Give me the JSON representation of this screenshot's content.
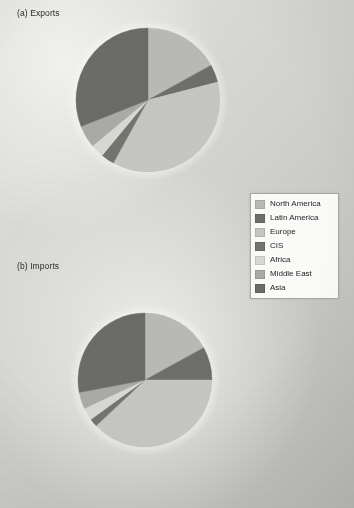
{
  "figure": {
    "panels": [
      {
        "id": "exports",
        "title": "(a) Exports"
      },
      {
        "id": "imports",
        "title": "(b) Imports"
      }
    ]
  },
  "legend": {
    "position": "middle-right",
    "entries": [
      {
        "label": "North America",
        "color": "#b9b9b7"
      },
      {
        "label": "Latin America",
        "color": "#6e6e6c"
      },
      {
        "label": "Europe",
        "color": "#c6c6c4"
      },
      {
        "label": "CIS",
        "color": "#74746f"
      },
      {
        "label": "Africa",
        "color": "#d8d8d4"
      },
      {
        "label": "Middle East",
        "color": "#aaaaa6"
      },
      {
        "label": "Asia",
        "color": "#6b6b69"
      }
    ]
  },
  "chart_data": [
    {
      "type": "pie",
      "title": "(a) Exports",
      "id": "exports",
      "categories": [
        "North America",
        "Latin America",
        "Europe",
        "CIS",
        "Africa",
        "Middle East",
        "Asia"
      ],
      "values": [
        17.0,
        4.0,
        37.0,
        3.0,
        3.0,
        5.0,
        31.0
      ],
      "colors": [
        "#b9b9b7",
        "#6e6e6c",
        "#c6c6c4",
        "#74746f",
        "#d8d8d4",
        "#aaaaa6",
        "#6b6b69"
      ],
      "units": "percent of world merchandise exports",
      "start_angle_deg": 0,
      "direction": "clockwise",
      "center_px": [
        148,
        100
      ],
      "radius_px": 72,
      "legend": true,
      "grid": false
    },
    {
      "type": "pie",
      "title": "(b) Imports",
      "id": "imports",
      "categories": [
        "North America",
        "Latin America",
        "Europe",
        "CIS",
        "Africa",
        "Middle East",
        "Asia"
      ],
      "values": [
        17.0,
        8.0,
        38.0,
        2.0,
        3.0,
        4.0,
        28.0
      ],
      "colors": [
        "#b9b9b7",
        "#6e6e6c",
        "#c6c6c4",
        "#74746f",
        "#d8d8d4",
        "#aaaaa6",
        "#6b6b69"
      ],
      "units": "percent of world merchandise imports",
      "start_angle_deg": 0,
      "direction": "clockwise",
      "center_px": [
        145,
        380
      ],
      "radius_px": 67,
      "legend": true,
      "grid": false
    }
  ]
}
